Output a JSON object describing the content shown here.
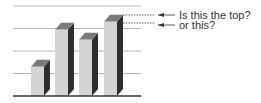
{
  "chart_data": {
    "type": "bar",
    "style": "3d",
    "title": "",
    "xlabel": "",
    "ylabel": "",
    "categories": [
      "1",
      "2",
      "3",
      "4"
    ],
    "values": [
      1.3,
      2.95,
      2.5,
      3.3
    ],
    "ylim": [
      0,
      4
    ],
    "grid": true,
    "gridlines": [
      1,
      2,
      3,
      4
    ],
    "annotations": [
      {
        "text": "Is this the top?",
        "target": "back edge of bar 4 top"
      },
      {
        "text": "or this?",
        "target": "front edge of bar 4 top"
      }
    ]
  },
  "colors": {
    "front": "#d4d4d4",
    "side": "#2e2e2e",
    "top": "#7a7a7a",
    "grid": "#b5b5b5",
    "axis": "#333333"
  },
  "annotations": {
    "top_label": "Is this the top?",
    "front_label": "or this?"
  }
}
